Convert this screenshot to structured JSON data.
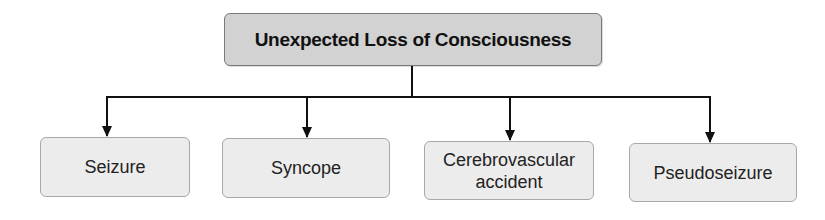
{
  "diagram": {
    "type": "tree",
    "root": {
      "label": "Unexpected Loss of Consciousness"
    },
    "children": [
      {
        "label": "Seizure"
      },
      {
        "label": "Syncope"
      },
      {
        "label": "Cerebrovascular accident"
      },
      {
        "label": "Pseudoseizure"
      }
    ],
    "colors": {
      "root_fill": "#d2d2d2",
      "child_fill": "#ececec",
      "connector": "#111111"
    }
  }
}
